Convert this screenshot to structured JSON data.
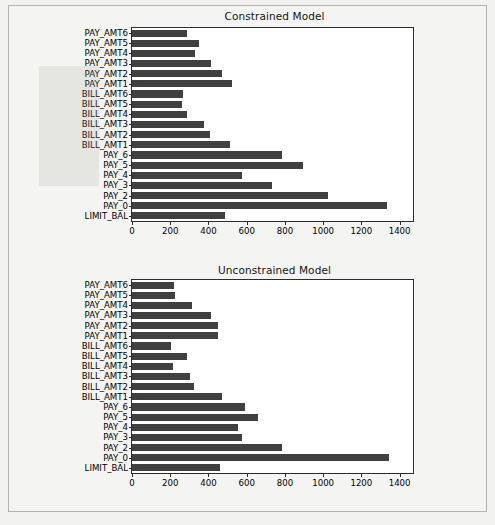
{
  "figure": {
    "background_color": "#f2f2f0",
    "bar_color": "#404040",
    "axis_color": "#2b2b2b"
  },
  "chart_data": [
    {
      "type": "bar",
      "orientation": "horizontal",
      "title": "Constrained Model",
      "xlabel": "",
      "ylabel": "",
      "xlim": [
        0,
        1470
      ],
      "xticks": [
        0,
        200,
        400,
        600,
        800,
        1000,
        1200,
        1400
      ],
      "xtick_labels": [
        "0",
        "200",
        "400",
        "600",
        "800",
        "1000",
        "1200",
        "1400"
      ],
      "grid": false,
      "legend": false,
      "categories": [
        "PAY_AMT6",
        "PAY_AMT5",
        "PAY_AMT4",
        "PAY_AMT3",
        "PAY_AMT2",
        "PAY_AMT1",
        "BILL_AMT6",
        "BILL_AMT5",
        "BILL_AMT4",
        "BILL_AMT3",
        "BILL_AMT2",
        "BILL_AMT1",
        "PAY_6",
        "PAY_5",
        "PAY_4",
        "PAY_3",
        "PAY_2",
        "PAY_0",
        "LIMIT_BAL"
      ],
      "values": [
        286,
        352,
        329,
        414,
        469,
        525,
        269,
        264,
        289,
        376,
        406,
        514,
        785,
        893,
        575,
        733,
        1026,
        1334,
        489
      ]
    },
    {
      "type": "bar",
      "orientation": "horizontal",
      "title": "Unconstrained Model",
      "xlabel": "",
      "ylabel": "",
      "xlim": [
        0,
        1470
      ],
      "xticks": [
        0,
        200,
        400,
        600,
        800,
        1000,
        1200,
        1400
      ],
      "xtick_labels": [
        "0",
        "200",
        "400",
        "600",
        "800",
        "1000",
        "1200",
        "1400"
      ],
      "grid": false,
      "legend": false,
      "categories": [
        "PAY_AMT6",
        "PAY_AMT5",
        "PAY_AMT4",
        "PAY_AMT3",
        "PAY_AMT2",
        "PAY_AMT1",
        "BILL_AMT6",
        "BILL_AMT5",
        "BILL_AMT4",
        "BILL_AMT3",
        "BILL_AMT2",
        "BILL_AMT1",
        "PAY_6",
        "PAY_5",
        "PAY_4",
        "PAY_3",
        "PAY_2",
        "PAY_0",
        "LIMIT_BAL"
      ],
      "values": [
        221,
        224,
        314,
        414,
        451,
        451,
        206,
        286,
        216,
        301,
        323,
        473,
        589,
        658,
        552,
        575,
        783,
        1343,
        462
      ]
    }
  ]
}
